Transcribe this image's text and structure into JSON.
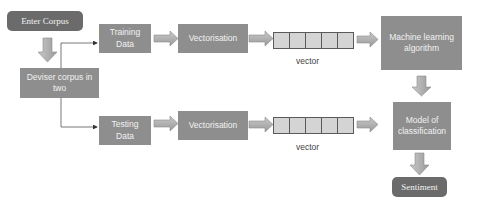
{
  "diagram": {
    "title": "",
    "nodes": {
      "enter_corpus": "Enter Corpus",
      "divide_corpus": "Deviser corpus in two",
      "training_data": "Training Data",
      "testing_data": "Testing Data",
      "vectorisation_train": "Vectorisation",
      "vectorisation_test": "Vectorisation",
      "vector_label_train": "vector",
      "vector_label_test": "vector",
      "ml_algorithm": "Machine learning algorithm",
      "model": "Model of classification",
      "sentiment": "Sentiment"
    },
    "vector_cells": 5,
    "edges": [
      {
        "from": "Enter Corpus",
        "to": "Deviser corpus in two"
      },
      {
        "from": "Deviser corpus in two",
        "to": "Training Data"
      },
      {
        "from": "Deviser corpus in two",
        "to": "Testing Data"
      },
      {
        "from": "Training Data",
        "to": "Vectorisation"
      },
      {
        "from": "Vectorisation",
        "to": "vector"
      },
      {
        "from": "vector",
        "to": "Machine learning algorithm"
      },
      {
        "from": "Machine learning algorithm",
        "to": "Model of classification"
      },
      {
        "from": "Testing Data",
        "to": "Vectorisation"
      },
      {
        "from": "Vectorisation",
        "to": "vector"
      },
      {
        "from": "vector",
        "to": "Model of classification"
      },
      {
        "from": "Model of classification",
        "to": "Sentiment"
      }
    ],
    "colors": {
      "terminal_box": "#6b6b6b",
      "process_box": "#8e8e8e",
      "vector_fill": "#d4d4d4",
      "arrow_fill": "#b5b5b5",
      "text": "#f2f2f2"
    }
  }
}
